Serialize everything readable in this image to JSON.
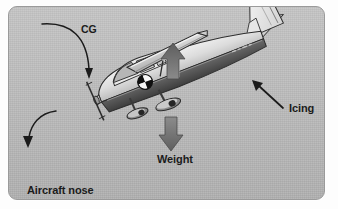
{
  "figure": {
    "kind": "aircraft-icing-center-of-gravity-diagram"
  },
  "labels": {
    "cg": "CG",
    "icing": "Icing",
    "weight": "Weight",
    "nose_line1": "Aircraft nose",
    "nose_line2": "pitches down"
  },
  "annotations": [
    {
      "name": "cg-leader",
      "label": "CG",
      "type": "curved-arrow",
      "from": "CG text label",
      "to": "center-of-gravity symbol on fuselage"
    },
    {
      "name": "icing-leader",
      "label": "Icing",
      "type": "straight-arrow",
      "from": "Icing text label",
      "to": "aft fuselage / tail leading edge"
    },
    {
      "name": "weight-vector",
      "label": "Weight",
      "type": "thick-down-arrow",
      "direction": "down",
      "meaning": "weight force acting downward"
    },
    {
      "name": "lift-vector",
      "label": "",
      "type": "thick-up-arrow",
      "direction": "up",
      "meaning": "lift force acting upward through the wing"
    },
    {
      "name": "nose-pitch-leader",
      "label": "Aircraft nose pitches down",
      "type": "curved-arrow",
      "from": "propeller / nose",
      "to": "Aircraft nose pitches down text label"
    }
  ],
  "icons": {
    "cg_symbol": "center-of-gravity-icon",
    "lift_arrow": "arrow-up-icon",
    "weight_arrow": "arrow-down-icon",
    "icing_arrow": "arrow-up-left-icon",
    "nose_arrow": "curved-arrow-down-left-icon",
    "cg_arrow": "curved-arrow-down-right-icon"
  },
  "colors": {
    "panel_background": "#b9b9b9",
    "panel_border": "#9a9a9a",
    "page_background": "#fdfdfd",
    "text": "#1b1b1b",
    "fuselage_light": "#e8e8e8",
    "fuselage_mid": "#bdbdbd",
    "fuselage_dark": "#4f4f4f",
    "fuselage_stripe": "#5a5a5a",
    "wing_top": "#d8d8d8",
    "wing_shadow": "#8e8e8e",
    "tail_fin": "#f2f2f2",
    "gear": "#7d7d7d",
    "force_arrow": "#6d6d6d",
    "force_arrow_highlight": "#f4f4f4",
    "cg_symbol_dark": "#111111",
    "cg_symbol_light": "#f7f7f7",
    "outline": "#2c2c2c"
  }
}
